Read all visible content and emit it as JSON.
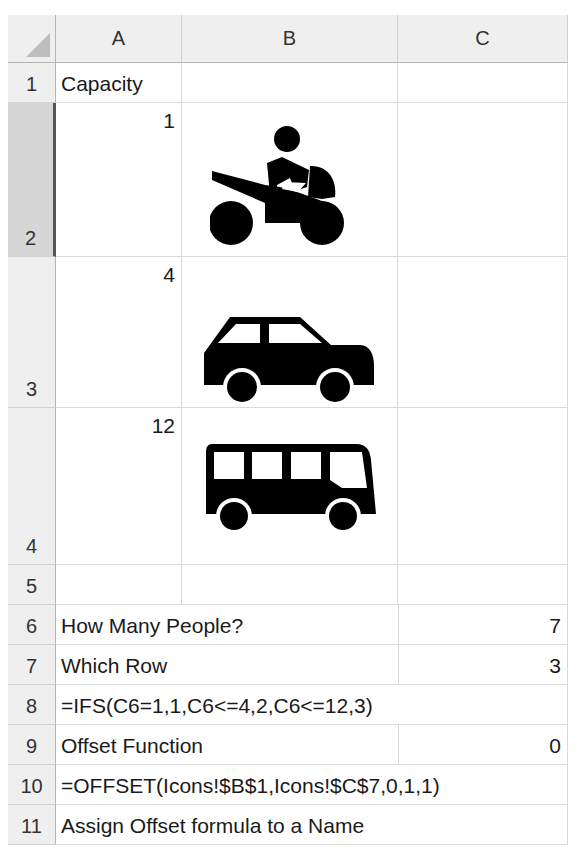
{
  "columns": [
    "A",
    "B",
    "C"
  ],
  "rows": [
    {
      "num": "1",
      "A": "Capacity",
      "B": "",
      "C": ""
    },
    {
      "num": "2",
      "A": "1",
      "B_icon": "motorcycle-icon",
      "C": ""
    },
    {
      "num": "3",
      "A": "4",
      "B_icon": "car-icon",
      "C": ""
    },
    {
      "num": "4",
      "A": "12",
      "B_icon": "bus-icon",
      "C": ""
    },
    {
      "num": "5",
      "A": "",
      "B": "",
      "C": ""
    },
    {
      "num": "6",
      "A": "How Many People?",
      "C": "7"
    },
    {
      "num": "7",
      "A": "Which Row",
      "C": "3"
    },
    {
      "num": "8",
      "A": "=IFS(C6=1,1,C6<=4,2,C6<=12,3)"
    },
    {
      "num": "9",
      "A": "Offset Function",
      "C": "0"
    },
    {
      "num": "10",
      "A": "=OFFSET(Icons!$B$1,Icons!$C$7,0,1,1)"
    },
    {
      "num": "11",
      "A": "Assign Offset formula to a Name"
    }
  ],
  "selected_row": "2",
  "colors": {
    "header_bg": "#efefef",
    "selected_header_bg": "#d6d6d6",
    "grid": "#dadada",
    "icon": "#000000"
  }
}
